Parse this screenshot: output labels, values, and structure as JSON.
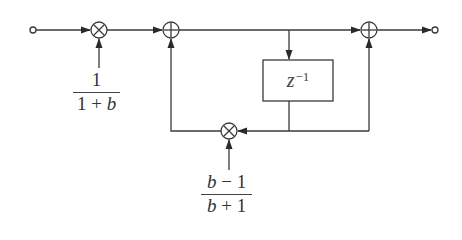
{
  "diagram": {
    "type": "signal-flow block diagram",
    "nodes": {
      "input": {
        "kind": "terminal",
        "x": 33,
        "y": 30
      },
      "mult_in": {
        "kind": "multiplier",
        "symbol": "×",
        "x": 99,
        "y": 30
      },
      "adder_1": {
        "kind": "adder",
        "symbol": "+",
        "x": 171,
        "y": 30
      },
      "adder_2": {
        "kind": "adder",
        "symbol": "+",
        "x": 369,
        "y": 30
      },
      "output": {
        "kind": "terminal",
        "x": 435,
        "y": 30
      },
      "mult_fb": {
        "kind": "multiplier",
        "symbol": "×",
        "x": 229,
        "y": 131
      },
      "delay": {
        "kind": "delay-block",
        "x": 263,
        "y": 60,
        "w": 70,
        "h": 41
      }
    },
    "labels": {
      "gain_in": {
        "numerator": "1",
        "denominator_pre": "1 + ",
        "denominator_var": "b"
      },
      "delay": {
        "base": "z",
        "exponent": "−1"
      },
      "gain_fb": {
        "numerator_var": "b",
        "numerator_post": " − 1",
        "denominator_var": "b",
        "denominator_post": " + 1"
      }
    },
    "edges": [
      "input → mult_in",
      "gain_in → mult_in",
      "mult_in → adder_1",
      "adder_1 → adder_2",
      "tap(adder_1→adder_2) → delay",
      "delay → mult_fb",
      "delay → adder_2",
      "gain_fb → mult_fb",
      "mult_fb → adder_1",
      "adder_2 → output"
    ]
  }
}
